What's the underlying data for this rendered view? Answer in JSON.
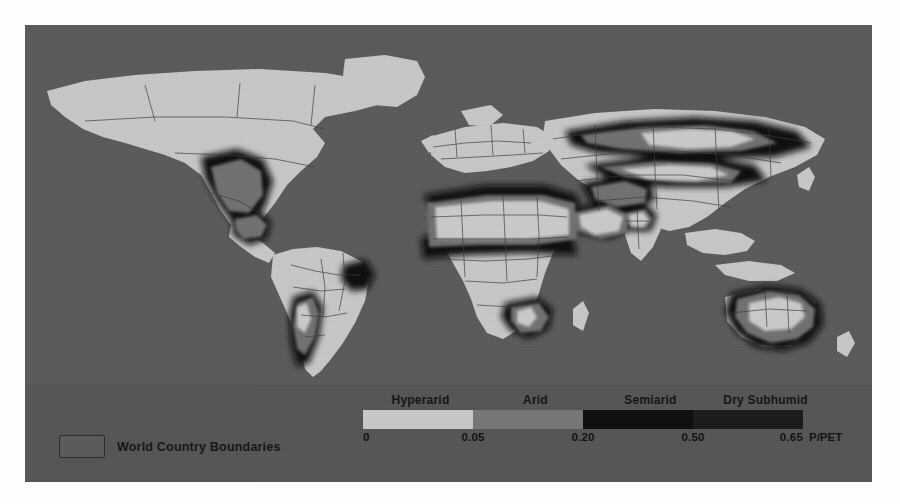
{
  "figure": {
    "background_color": "#555555",
    "page_color": "#ffffff"
  },
  "map": {
    "projection": "equirectangular",
    "ocean_color": "#5a5a5a",
    "land_color": "#c9c9c9",
    "boundary_color": "#3a3a3a",
    "description": "Global aridity index map showing hyperarid, arid, semiarid and dry subhumid drylands"
  },
  "legend": {
    "boundary_key": {
      "label": "World Country Boundaries",
      "swatch_fill": "#5a5a5a",
      "swatch_border": "#2b2b2b"
    },
    "classes": [
      {
        "name": "Hyperarid",
        "color": "#c9c9c9",
        "range_start": "0",
        "range_end": "0.05",
        "center_pct": 12.5
      },
      {
        "name": "Arid",
        "color": "#767676",
        "range_start": "0.05",
        "range_end": "0.20",
        "center_pct": 37.5
      },
      {
        "name": "Semiarid",
        "color": "#0d0d0d",
        "range_start": "0.20",
        "range_end": "0.50",
        "center_pct": 62.5
      },
      {
        "name": "Dry Subhumid",
        "color": "#1a1a1a",
        "range_start": "0.50",
        "range_end": "0.65",
        "center_pct": 87.5
      }
    ],
    "ticks": [
      {
        "value": "0",
        "pos_pct": 0
      },
      {
        "value": "0.05",
        "pos_pct": 25
      },
      {
        "value": "0.20",
        "pos_pct": 50
      },
      {
        "value": "0.50",
        "pos_pct": 75
      },
      {
        "value": "0.65",
        "pos_pct": 100
      }
    ],
    "unit": "P/PET"
  },
  "chart_data": {
    "type": "map",
    "title": "",
    "variable": "Aridity Index (P/PET)",
    "unit": "P/PET",
    "categories": [
      "Hyperarid",
      "Arid",
      "Semiarid",
      "Dry Subhumid"
    ],
    "class_breaks": [
      0,
      0.05,
      0.2,
      0.5,
      0.65
    ],
    "class_colors": [
      "#c9c9c9",
      "#767676",
      "#0d0d0d",
      "#1a1a1a"
    ],
    "legend_position": "bottom",
    "extra_legend_entries": [
      "World Country Boundaries"
    ]
  }
}
